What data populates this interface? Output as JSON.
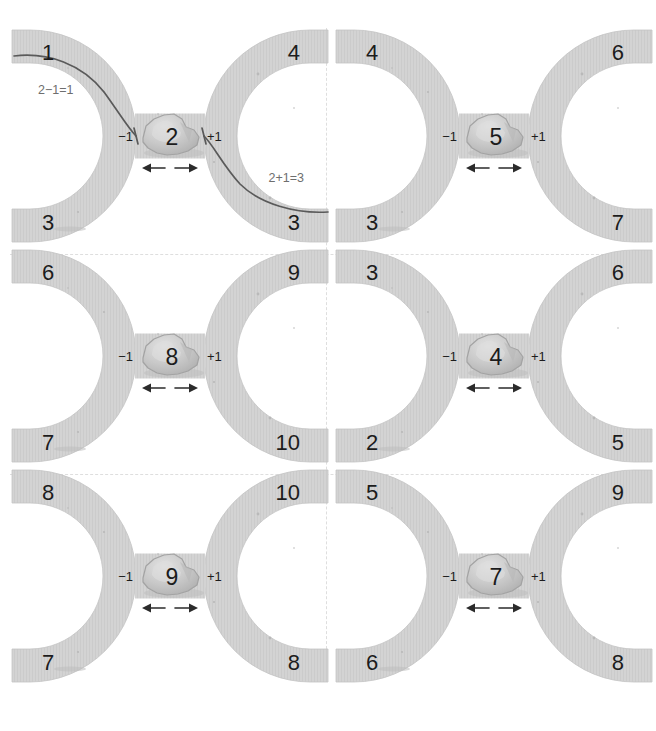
{
  "worksheet": {
    "title": "Number neighbours — one less and one more",
    "layout": {
      "columns": 2,
      "rows": 3
    },
    "colors": {
      "band_fill": "#d3d3d3",
      "pebble_fill": "#c9c9c9",
      "pebble_stroke": "#a9a9a9",
      "ink": "#1c1c1c",
      "annotation": "#6e6e6e",
      "separator": "#dedede",
      "background": "#ffffff"
    },
    "shared_labels": {
      "minus_one": "−1",
      "plus_one": "+1"
    },
    "panels": [
      {
        "id": "panel-1",
        "index": 1,
        "center": "2",
        "minus_label": "−1",
        "plus_label": "+1",
        "top_left": "1",
        "bottom_left": "3",
        "top_right": "4",
        "bottom_right": "3",
        "equation_left": "2−1=1",
        "equation_right": "2+1=3",
        "has_traces": true,
        "is_worked_example": true
      },
      {
        "id": "panel-2",
        "index": 2,
        "center": "5",
        "minus_label": "−1",
        "plus_label": "+1",
        "top_left": "4",
        "bottom_left": "3",
        "top_right": "6",
        "bottom_right": "7",
        "equation_left": "",
        "equation_right": "",
        "has_traces": false,
        "is_worked_example": false
      },
      {
        "id": "panel-3",
        "index": 3,
        "center": "8",
        "minus_label": "−1",
        "plus_label": "+1",
        "top_left": "6",
        "bottom_left": "7",
        "top_right": "9",
        "bottom_right": "10",
        "equation_left": "",
        "equation_right": "",
        "has_traces": false,
        "is_worked_example": false
      },
      {
        "id": "panel-4",
        "index": 4,
        "center": "4",
        "minus_label": "−1",
        "plus_label": "+1",
        "top_left": "3",
        "bottom_left": "2",
        "top_right": "6",
        "bottom_right": "5",
        "equation_left": "",
        "equation_right": "",
        "has_traces": false,
        "is_worked_example": false
      },
      {
        "id": "panel-5",
        "index": 5,
        "center": "9",
        "minus_label": "−1",
        "plus_label": "+1",
        "top_left": "8",
        "bottom_left": "7",
        "top_right": "10",
        "bottom_right": "8",
        "equation_left": "",
        "equation_right": "",
        "has_traces": false,
        "is_worked_example": false
      },
      {
        "id": "panel-6",
        "index": 6,
        "center": "7",
        "minus_label": "−1",
        "plus_label": "+1",
        "top_left": "5",
        "bottom_left": "6",
        "top_right": "9",
        "bottom_right": "8",
        "equation_left": "",
        "equation_right": "",
        "has_traces": false,
        "is_worked_example": false
      }
    ]
  }
}
